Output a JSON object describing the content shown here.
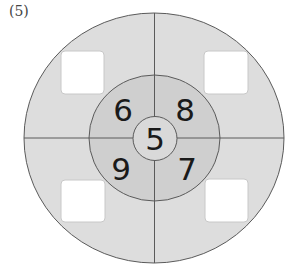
{
  "problem_label": "(5)",
  "diagram": {
    "center_number": "5",
    "inner_numbers": {
      "top_left": "6",
      "top_right": "8",
      "bottom_left": "9",
      "bottom_right": "7"
    },
    "answer_boxes": [
      {
        "position": "top-left",
        "value": ""
      },
      {
        "position": "top-right",
        "value": ""
      },
      {
        "position": "bottom-left",
        "value": ""
      },
      {
        "position": "bottom-right",
        "value": ""
      }
    ],
    "colors": {
      "outer_ring": "#dddddd",
      "inner_ring": "#cfcfcf",
      "center_circle": "#d9d9d9",
      "lines": "#5a5a5a",
      "boxes": "#ffffff"
    }
  }
}
